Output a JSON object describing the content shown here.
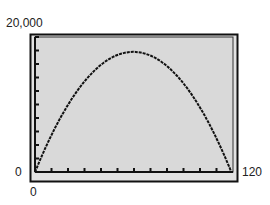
{
  "chart_data": {
    "type": "line",
    "title": "",
    "xlabel": "",
    "ylabel": "",
    "xlim": [
      0,
      120
    ],
    "ylim": [
      0,
      20000
    ],
    "grid": false,
    "legend": null,
    "tick_labels": {
      "y_max": "20,000",
      "y_min": "0",
      "x_min": "0",
      "x_max": "120"
    },
    "x_tick_step": 10,
    "y_tick_step": 2000,
    "series": [
      {
        "name": "curve",
        "description": "parabola opening downward, zeros at x=0 and x=119, vertex near (60, 17800)",
        "x": [
          0,
          10,
          20,
          30,
          40,
          50,
          60,
          70,
          80,
          90,
          100,
          110,
          119
        ],
        "y": [
          0,
          4950,
          9900,
          13600,
          16100,
          17400,
          17800,
          17400,
          16100,
          13600,
          9900,
          4950,
          0
        ]
      }
    ],
    "colors": {
      "plot_background": "#d9d9d9",
      "frame": "#111111",
      "curve": "#111111"
    }
  }
}
